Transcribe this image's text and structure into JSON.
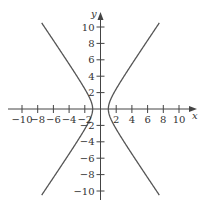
{
  "chart_data": {
    "type": "line",
    "title": "",
    "xlabel": "x",
    "ylabel": "y",
    "xlim": [
      -11,
      11
    ],
    "ylim": [
      -11,
      11
    ],
    "grid": false,
    "x_ticks": [
      -10,
      -8,
      -6,
      -4,
      -2,
      2,
      4,
      6,
      8,
      10
    ],
    "x_tick_labels": [
      "−10",
      "−8",
      "−6",
      "−4",
      "−2",
      "2",
      "4",
      "6",
      "8",
      "10"
    ],
    "y_ticks": [
      10,
      8,
      6,
      4,
      2,
      -2,
      -4,
      -6,
      -8,
      -10
    ],
    "y_tick_labels": [
      "10",
      "8",
      "6",
      "4",
      "2",
      "−2",
      "−4",
      "−6",
      "−8",
      "−10"
    ],
    "curve": "hyperbola x^2 - y^2/2 = 1",
    "series": [
      {
        "name": "right-branch",
        "points": [
          [
            7.4,
            10.5
          ],
          [
            5,
            6.93
          ],
          [
            3,
            4
          ],
          [
            2,
            2.45
          ],
          [
            1.5,
            1.58
          ],
          [
            1,
            0
          ],
          [
            1.5,
            -1.58
          ],
          [
            2,
            -2.45
          ],
          [
            3,
            -4
          ],
          [
            5,
            -6.93
          ],
          [
            7.4,
            -10.5
          ]
        ]
      },
      {
        "name": "left-branch",
        "points": [
          [
            -7.4,
            10.5
          ],
          [
            -5,
            6.93
          ],
          [
            -3,
            4
          ],
          [
            -2,
            2.45
          ],
          [
            -1.5,
            1.58
          ],
          [
            -1,
            0
          ],
          [
            -1.5,
            -1.58
          ],
          [
            -2,
            -2.45
          ],
          [
            -3,
            -4
          ],
          [
            -5,
            -6.93
          ],
          [
            -7.4,
            -10.5
          ]
        ]
      }
    ],
    "colors": {
      "curve": "#555555",
      "axis": "#444444",
      "text": "#333333"
    }
  }
}
